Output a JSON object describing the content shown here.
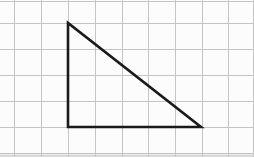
{
  "figure": {
    "background_color": "#fcfcfc",
    "grid": {
      "line_color": "#c4c4c4",
      "line_width": 1,
      "vertical_x": [
        14,
        41,
        68,
        95,
        122,
        148,
        175,
        202,
        228,
        253
      ],
      "horizontal_y": [
        1,
        23,
        49,
        75,
        101,
        127,
        153
      ],
      "cell_size_px": 26.5
    },
    "triangle": {
      "stroke_color": "#1a1a1a",
      "stroke_width": 2.6,
      "vertices_px": [
        [
          68,
          23
        ],
        [
          68,
          127
        ],
        [
          201,
          127
        ]
      ],
      "vertices_grid_units": [
        [
          2,
          1
        ],
        [
          2,
          5
        ],
        [
          7,
          5
        ]
      ],
      "leg_lengths_grid_units": {
        "vertical": 4,
        "horizontal": 5
      },
      "right_angle_corner": "bottom-left"
    },
    "edges": {
      "bottom_shadow_color": "#cccccc"
    }
  }
}
